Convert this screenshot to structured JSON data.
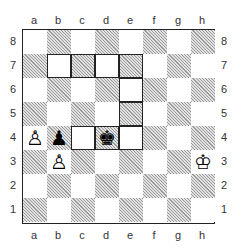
{
  "diagram": {
    "files": [
      "a",
      "b",
      "c",
      "d",
      "e",
      "f",
      "g",
      "h"
    ],
    "ranks": [
      "8",
      "7",
      "6",
      "5",
      "4",
      "3",
      "2",
      "1"
    ],
    "pieces": [
      {
        "square": "a4",
        "piece": "white-pawn",
        "glyph": "♙"
      },
      {
        "square": "b3",
        "piece": "white-pawn",
        "glyph": "♙"
      },
      {
        "square": "b4",
        "piece": "black-pawn",
        "glyph": "♟"
      },
      {
        "square": "d4",
        "piece": "black-king",
        "glyph": "♚"
      },
      {
        "square": "h3",
        "piece": "white-king",
        "glyph": "♔"
      }
    ],
    "highlighted_squares": [
      "b7",
      "c7",
      "d7",
      "e7",
      "e6",
      "e5",
      "e4",
      "d4",
      "c4"
    ]
  }
}
